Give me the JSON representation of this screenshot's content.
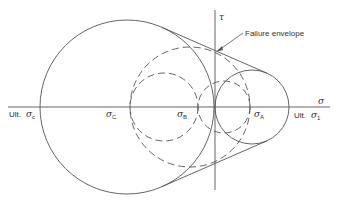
{
  "diagram": {
    "axes": {
      "tau_label": "τ",
      "sigma_label": "σ"
    },
    "annotation": {
      "failure_envelope": "Failure envelope"
    },
    "labels": {
      "ult_sigma_c_prefix": "Ult.",
      "ult_sigma_c_symbol": "σ",
      "ult_sigma_c_sub": "c",
      "sigma_c_symbol": "σ",
      "sigma_c_sub": "C",
      "sigma_b_symbol": "σ",
      "sigma_b_sub": "B",
      "sigma_a_symbol": "σ",
      "sigma_a_sub": "A",
      "ult_sigma_1_prefix": "Ult.",
      "ult_sigma_1_symbol": "σ",
      "ult_sigma_1_sub": "1"
    },
    "circles": [
      {
        "name": "ultimate-compression-circle",
        "style": "solid"
      },
      {
        "name": "ultimate-tension-circle",
        "style": "solid"
      },
      {
        "name": "circle-sigma-c-sigma-b",
        "style": "dashed"
      },
      {
        "name": "circle-sigma-c-sigma-a",
        "style": "dashed"
      },
      {
        "name": "circle-sigma-b-sigma-a",
        "style": "dashed"
      }
    ],
    "line_color": "#4a4a4a"
  }
}
